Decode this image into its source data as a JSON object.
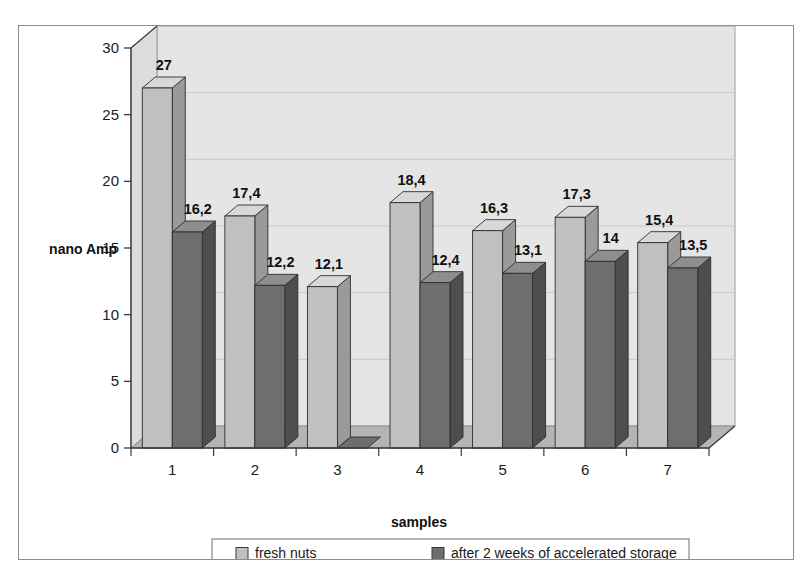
{
  "chart_data": {
    "type": "bar",
    "title": "",
    "xlabel": "samples",
    "ylabel": "nano Amp",
    "categories": [
      "1",
      "2",
      "3",
      "4",
      "5",
      "6",
      "7"
    ],
    "ylim": [
      0,
      30
    ],
    "yticks": [
      0,
      5,
      10,
      15,
      20,
      25,
      30
    ],
    "ytick_labels": [
      "0",
      "5",
      "10",
      "15",
      "20",
      "25",
      "30"
    ],
    "grid": true,
    "grid_axis": "y",
    "legend_position": "bottom",
    "three_d": true,
    "series": [
      {
        "name": "fresh nuts",
        "color": "#c0c0c0",
        "values": [
          27,
          17.4,
          12.1,
          18.4,
          16.3,
          17.3,
          15.4
        ],
        "labels": [
          "27",
          "17,4",
          "12,1",
          "18,4",
          "16,3",
          "17,3",
          "15,4"
        ]
      },
      {
        "name": "after 2 weeks of accelerated storage",
        "color": "#6e6e6e",
        "values": [
          16.2,
          12.2,
          0,
          12.4,
          13.1,
          14,
          13.5
        ],
        "labels": [
          "16,2",
          "12,2",
          "",
          "12,4",
          "13,1",
          "14",
          "13,5"
        ]
      }
    ]
  },
  "colors": {
    "plot_background": "#e5e5e5",
    "floor": "#b4b4b4",
    "gridline": "#c9c9c9",
    "axis": "#3a3a3a",
    "frame_border": "#8d8d8d",
    "series_1_face": "#c0c0c0",
    "series_1_top": "#d8d8d8",
    "series_1_side": "#9a9a9a",
    "series_2_face": "#6e6e6e",
    "series_2_top": "#8e8e8e",
    "series_2_side": "#4e4e4e"
  },
  "legend": {
    "items": [
      {
        "label": "fresh nuts",
        "marker": "series-1-swatch"
      },
      {
        "label": "after 2 weeks of accelerated storage",
        "marker": "series-2-swatch"
      }
    ]
  }
}
